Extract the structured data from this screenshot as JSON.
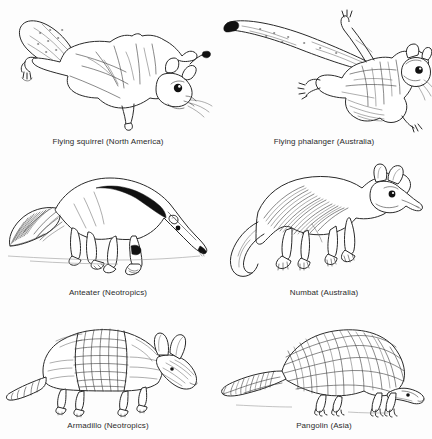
{
  "figure": {
    "type": "illustration-grid",
    "background_color": "#fdfdfd",
    "line_color": "#2a2a2a",
    "text_color": "#2b2b2b",
    "columns": 2,
    "rows": 3,
    "panels": [
      {
        "id": "flying-squirrel",
        "caption": "Flying squirrel (North America)",
        "animal": "flying squirrel",
        "region": "North America",
        "pose": "gliding with patagium extended, flat tail upper-left, head lower-right"
      },
      {
        "id": "flying-phalanger",
        "caption": "Flying phalanger (Australia)",
        "animal": "flying phalanger",
        "region": "Australia",
        "pose": "gliding with patagium extended, long bushy tail to the left, head at right"
      },
      {
        "id": "anteater",
        "caption": "Anteater (Neotropics)",
        "animal": "anteater",
        "region": "Neotropics",
        "pose": "standing in profile facing right, long snout down, bushy tail left, black shoulder wedge"
      },
      {
        "id": "numbat",
        "caption": "Numbat (Australia)",
        "animal": "numbat",
        "region": "Australia",
        "pose": "standing in profile facing right, striped back, long tapering tail curving left"
      },
      {
        "id": "armadillo",
        "caption": "Armadillo (Neotropics)",
        "animal": "armadillo",
        "region": "Neotropics",
        "pose": "walking in profile facing right, banded carapace, segmented tail left, long ears"
      },
      {
        "id": "pangolin",
        "caption": "Pangolin (Asia)",
        "animal": "pangolin",
        "region": "Asia",
        "pose": "walking in profile facing right, overlapping scales, thick scaled tail left"
      }
    ]
  }
}
